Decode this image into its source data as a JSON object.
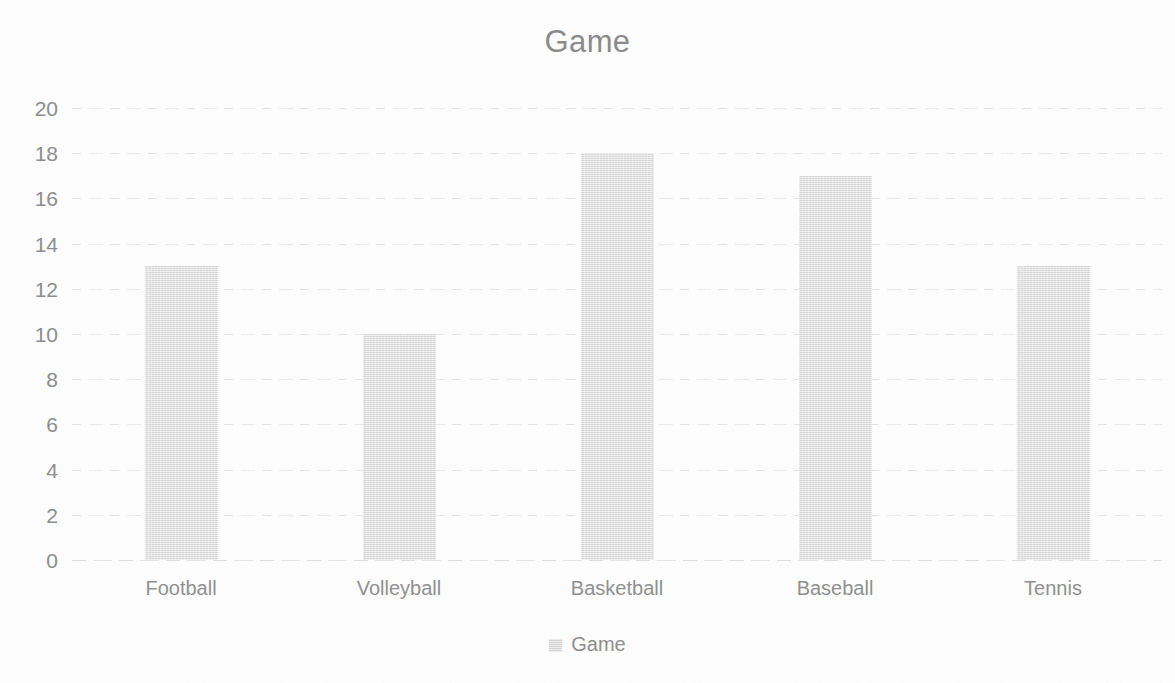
{
  "chart_data": {
    "type": "bar",
    "title": "Game",
    "xlabel": "",
    "ylabel": "",
    "categories": [
      "Football",
      "Volleyball",
      "Basketball",
      "Baseball",
      "Tennis"
    ],
    "values": [
      13,
      10,
      18,
      17,
      13
    ],
    "series": [
      {
        "name": "Game",
        "values": [
          13,
          10,
          18,
          17,
          13
        ]
      }
    ],
    "ylim": [
      0,
      20
    ],
    "ytick_step": 2,
    "ytick_labels": [
      "20",
      "18",
      "16",
      "14",
      "12",
      "10",
      "8",
      "6",
      "4",
      "2",
      "0"
    ],
    "ytick_values": [
      20,
      18,
      16,
      14,
      12,
      10,
      8,
      6,
      4,
      2,
      0
    ],
    "grid": true,
    "grid_axis": "y",
    "legend": {
      "position": "bottom",
      "entries": [
        "Game"
      ]
    },
    "colors": {
      "bar_fill": "#e2e2e2",
      "title_text": "#8a8a8a",
      "axis_text": "#8c8c8c",
      "gridline": "#cdcdd4",
      "background": "#ffffff"
    }
  }
}
